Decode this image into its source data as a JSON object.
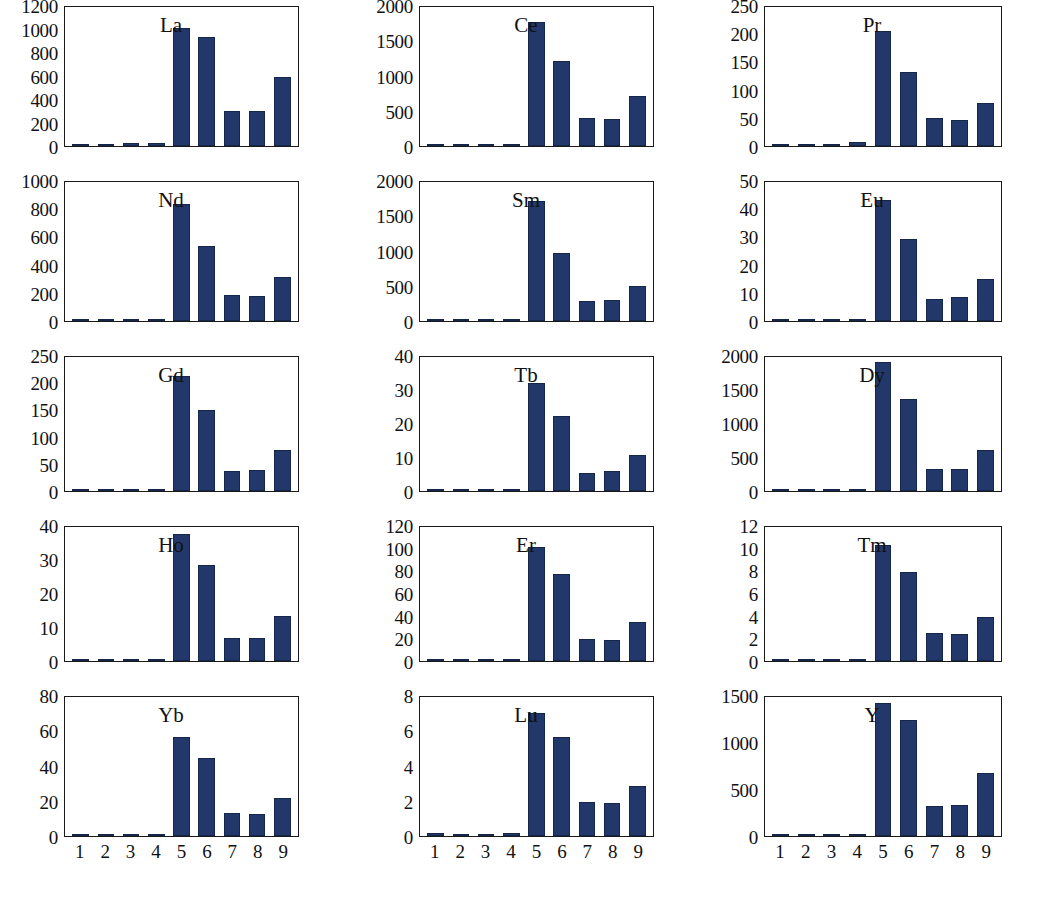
{
  "figure": {
    "title": "",
    "caption": "",
    "bar_color": "#22386b",
    "axis_color": "#1a1a1a",
    "background": "#ffffff"
  },
  "chart_data": {
    "type": "bar",
    "title": "",
    "xlabel": "",
    "ylabel": "",
    "grid": false,
    "legend": "none",
    "categories": [
      "1",
      "2",
      "3",
      "4",
      "5",
      "6",
      "7",
      "8",
      "9"
    ],
    "panel_layout": {
      "rows": 5,
      "cols": 3
    },
    "panels": [
      {
        "name": "La",
        "ylim": [
          0,
          1200
        ],
        "yticks": [
          0,
          200,
          400,
          600,
          800,
          1000,
          1200
        ],
        "ytick_labels": [
          "0",
          "200",
          "400",
          "600",
          "800",
          "1000",
          "1200"
        ],
        "values": [
          18,
          14,
          28,
          25,
          1020,
          945,
          305,
          305,
          595
        ]
      },
      {
        "name": "Ce",
        "ylim": [
          0,
          2000
        ],
        "yticks": [
          0,
          500,
          1000,
          1500,
          2000
        ],
        "ytick_labels": [
          "0",
          "500",
          "1000",
          "1500",
          "2000"
        ],
        "values": [
          32,
          20,
          30,
          32,
          1780,
          1220,
          400,
          385,
          720
        ]
      },
      {
        "name": "Pr",
        "ylim": [
          0,
          250
        ],
        "yticks": [
          0,
          50,
          100,
          150,
          200,
          250
        ],
        "ytick_labels": [
          "0",
          "50",
          "100",
          "150",
          "200",
          "250"
        ],
        "values": [
          3,
          3,
          3,
          7,
          207,
          134,
          51,
          47,
          78
        ]
      },
      {
        "name": "Nd",
        "ylim": [
          0,
          1000
        ],
        "yticks": [
          0,
          200,
          400,
          600,
          800,
          1000
        ],
        "ytick_labels": [
          "0",
          "200",
          "400",
          "600",
          "800",
          "1000"
        ],
        "values": [
          18,
          10,
          18,
          16,
          840,
          540,
          190,
          180,
          315
        ]
      },
      {
        "name": "Sm",
        "ylim": [
          0,
          2000
        ],
        "yticks": [
          0,
          500,
          1000,
          1500,
          2000
        ],
        "ytick_labels": [
          "0",
          "500",
          "1000",
          "1500",
          "2000"
        ],
        "values": [
          25,
          18,
          18,
          20,
          1720,
          985,
          295,
          300,
          505
        ]
      },
      {
        "name": "Eu",
        "ylim": [
          0,
          50
        ],
        "yticks": [
          0,
          10,
          20,
          30,
          40,
          50
        ],
        "ytick_labels": [
          "0",
          "10",
          "20",
          "30",
          "40",
          "50"
        ],
        "values": [
          0.8,
          0.4,
          0.8,
          0.8,
          43.5,
          29.5,
          8,
          8.5,
          15
        ]
      },
      {
        "name": "Gd",
        "ylim": [
          0,
          250
        ],
        "yticks": [
          0,
          50,
          100,
          150,
          200,
          250
        ],
        "ytick_labels": [
          "0",
          "50",
          "100",
          "150",
          "200",
          "250"
        ],
        "values": [
          2,
          2,
          2,
          2,
          214,
          152,
          37,
          40,
          77
        ]
      },
      {
        "name": "Tb",
        "ylim": [
          0,
          40
        ],
        "yticks": [
          0,
          10,
          20,
          30,
          40
        ],
        "ytick_labels": [
          "0",
          "10",
          "20",
          "30",
          "40"
        ],
        "values": [
          0.4,
          0.3,
          0.3,
          0.4,
          32.3,
          22.3,
          5.5,
          6,
          10.7
        ]
      },
      {
        "name": "Dy",
        "ylim": [
          0,
          2000
        ],
        "yticks": [
          0,
          500,
          1000,
          1500,
          2000
        ],
        "ytick_labels": [
          "0",
          "500",
          "1000",
          "1500",
          "2000"
        ],
        "values": [
          22,
          8,
          8,
          22,
          1930,
          1380,
          330,
          335,
          615
        ]
      },
      {
        "name": "Ho",
        "ylim": [
          0,
          40
        ],
        "yticks": [
          0,
          10,
          20,
          30,
          40
        ],
        "ytick_labels": [
          "0",
          "10",
          "20",
          "30",
          "40"
        ],
        "values": [
          0.3,
          0.2,
          0.2,
          0.2,
          38,
          28.8,
          7,
          7,
          13.5
        ]
      },
      {
        "name": "Er",
        "ylim": [
          0,
          120
        ],
        "yticks": [
          0,
          20,
          40,
          60,
          80,
          100,
          120
        ],
        "ytick_labels": [
          "0",
          "20",
          "40",
          "60",
          "80",
          "100",
          "120"
        ],
        "values": [
          1,
          0.8,
          0.8,
          1,
          102,
          78,
          20,
          19,
          35
        ]
      },
      {
        "name": "Tm",
        "ylim": [
          0,
          12
        ],
        "yticks": [
          0,
          2,
          4,
          6,
          8,
          10,
          12
        ],
        "ytick_labels": [
          "0",
          "2",
          "4",
          "6",
          "8",
          "10",
          "12"
        ],
        "values": [
          0.1,
          0.08,
          0.08,
          0.1,
          10.4,
          8.0,
          2.5,
          2.4,
          3.9
        ]
      },
      {
        "name": "Yb",
        "ylim": [
          0,
          80
        ],
        "yticks": [
          0,
          20,
          40,
          60,
          80
        ],
        "ytick_labels": [
          "0",
          "20",
          "40",
          "60",
          "80"
        ],
        "values": [
          0.8,
          0.6,
          0.6,
          0.8,
          57,
          45,
          13.5,
          12.5,
          22
        ]
      },
      {
        "name": "Lu",
        "ylim": [
          0,
          8
        ],
        "yticks": [
          0,
          2,
          4,
          6,
          8
        ],
        "ytick_labels": [
          "0",
          "2",
          "4",
          "6",
          "8"
        ],
        "values": [
          0.18,
          0.08,
          0.08,
          0.15,
          7.1,
          5.7,
          1.95,
          1.9,
          2.85
        ]
      },
      {
        "name": "Y",
        "ylim": [
          0,
          1500
        ],
        "yticks": [
          0,
          500,
          1000,
          1500
        ],
        "ytick_labels": [
          "0",
          "500",
          "1000",
          "1500"
        ],
        "values": [
          2,
          1,
          1,
          2,
          1435,
          1255,
          320,
          340,
          680
        ]
      }
    ]
  }
}
